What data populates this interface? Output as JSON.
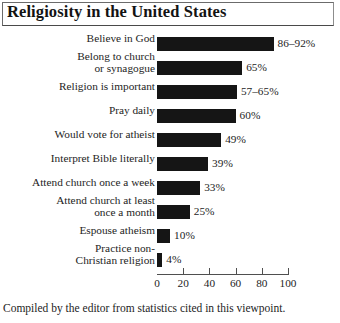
{
  "figure": {
    "title": "Religiosity in the United States",
    "footer": "Compiled by the editor from statistics cited in this viewpoint."
  },
  "chart_data": {
    "type": "bar",
    "orientation": "horizontal",
    "title": "Religiosity in the United States",
    "xlabel": "",
    "ylabel": "",
    "xlim": [
      0,
      100
    ],
    "xticks": [
      0,
      20,
      40,
      60,
      80,
      100
    ],
    "grid": false,
    "legend": false,
    "bar_color": "#151515",
    "categories": [
      "Believe in God",
      "Belong to church\nor synagogue",
      "Religion is important",
      "Pray daily",
      "Would vote for atheist",
      "Interpret Bible literally",
      "Attend church once a week",
      "Attend church at least\nonce a month",
      "Espouse atheism",
      "Practice non-\nChristian religion"
    ],
    "values": [
      89,
      65,
      61,
      60,
      49,
      39,
      33,
      25,
      10,
      4
    ],
    "value_labels": [
      "86–92%",
      "65%",
      "57–65%",
      "60%",
      "49%",
      "39%",
      "33%",
      "25%",
      "10%",
      "4%"
    ]
  }
}
